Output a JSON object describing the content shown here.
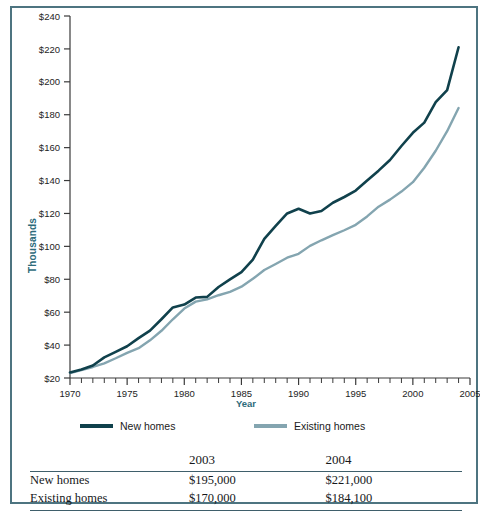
{
  "chart_data": {
    "type": "line",
    "title": "",
    "xlabel": "Year",
    "ylabel": "Thousands",
    "xlim": [
      1970,
      2005
    ],
    "ylim": [
      20,
      240
    ],
    "ytick_labels": [
      "$240",
      "$220",
      "$200",
      "$180",
      "$160",
      "$140",
      "$120",
      "$100",
      "$80",
      "$60",
      "$40",
      "$20"
    ],
    "ytick_values": [
      240,
      220,
      200,
      180,
      160,
      140,
      120,
      100,
      80,
      60,
      40,
      20
    ],
    "xtick_labels": [
      "1970",
      "1975",
      "1980",
      "1985",
      "1990",
      "1995",
      "2000",
      "2005"
    ],
    "xtick_values": [
      1970,
      1975,
      1980,
      1985,
      1990,
      1995,
      2000,
      2005
    ],
    "minor_xticks": "every 1 year",
    "grid": false,
    "legend_position": "below-axes",
    "x": [
      1970,
      1971,
      1972,
      1973,
      1974,
      1975,
      1976,
      1977,
      1978,
      1979,
      1980,
      1981,
      1982,
      1983,
      1984,
      1985,
      1986,
      1987,
      1988,
      1989,
      1990,
      1991,
      1992,
      1993,
      1994,
      1995,
      1996,
      1997,
      1998,
      1999,
      2000,
      2001,
      2002,
      2003,
      2004
    ],
    "series": [
      {
        "name": "New homes",
        "color": "#10414c",
        "values": [
          23.4,
          25.2,
          27.6,
          32.5,
          35.9,
          39.3,
          44.2,
          48.8,
          55.7,
          62.9,
          64.6,
          68.9,
          69.3,
          75.3,
          79.9,
          84.3,
          92.0,
          104.5,
          112.5,
          120.0,
          122.9,
          120.0,
          121.5,
          126.5,
          130.0,
          133.9,
          140.0,
          146.0,
          152.5,
          161.0,
          169.0,
          175.2,
          187.6,
          195.0,
          221.0
        ]
      },
      {
        "name": "Existing homes",
        "color": "#84a5b0",
        "values": [
          23.0,
          24.8,
          26.7,
          28.9,
          32.0,
          35.3,
          38.1,
          42.9,
          48.7,
          55.7,
          62.2,
          66.4,
          67.8,
          70.3,
          72.4,
          75.5,
          80.3,
          85.6,
          89.3,
          93.1,
          95.5,
          100.3,
          103.7,
          106.8,
          109.8,
          113.1,
          118.2,
          124.1,
          128.4,
          133.3,
          139.0,
          147.8,
          158.1,
          170.0,
          184.1
        ]
      }
    ]
  },
  "legend": {
    "items": [
      {
        "label": "New homes",
        "color": "#10414c"
      },
      {
        "label": "Existing homes",
        "color": "#84a5b0"
      }
    ]
  },
  "table": {
    "columns": [
      "",
      "2003",
      "2004"
    ],
    "rows": [
      {
        "label": "New homes",
        "v2003": "$195,000",
        "v2004": "$221,000"
      },
      {
        "label": "Existing homes",
        "v2003": "$170,000",
        "v2004": "$184,100"
      }
    ]
  },
  "colors": {
    "border": "#4d7480",
    "axis_text": "#2d6b7a",
    "new_homes": "#10414c",
    "existing_homes": "#84a5b0",
    "rule": "#3f5f6b"
  }
}
